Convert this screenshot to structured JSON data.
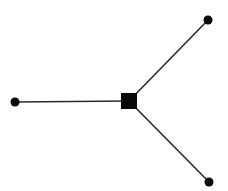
{
  "diagram": {
    "type": "star-graph",
    "colors": {
      "background": "#ffffff",
      "edge": "#2a2a2a",
      "node": "#0a0a0a"
    },
    "hub": {
      "id": "hub",
      "shape": "square",
      "cx": 129,
      "cy": 101,
      "size": 16
    },
    "leaves": [
      {
        "id": "leaf-left",
        "shape": "circle",
        "cx": 15,
        "cy": 102,
        "r": 4.5
      },
      {
        "id": "leaf-top-right",
        "shape": "circle",
        "cx": 208,
        "cy": 20,
        "r": 4.5
      },
      {
        "id": "leaf-bottom-right",
        "shape": "circle",
        "cx": 209,
        "cy": 182,
        "r": 4.5
      }
    ],
    "edges": [
      {
        "from": "hub",
        "to": "leaf-left"
      },
      {
        "from": "hub",
        "to": "leaf-top-right"
      },
      {
        "from": "hub",
        "to": "leaf-bottom-right"
      }
    ]
  }
}
